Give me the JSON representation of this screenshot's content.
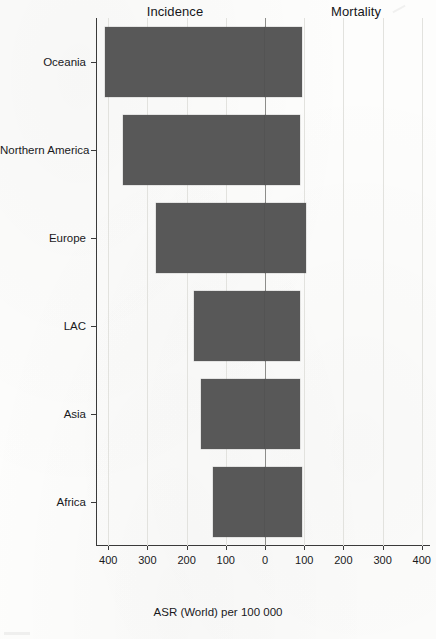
{
  "figure": {
    "panel_headers": {
      "left": "Incidence",
      "right": "Mortality"
    },
    "axis_title": "ASR (World) per 100 000",
    "bar_color": "#585858",
    "grid_color": "#e2e2de",
    "zero_line_color": "#8d8d8a"
  },
  "chart_data": {
    "type": "bar",
    "orientation": "horizontal",
    "subtype": "back-to-back population pyramid (mirrored bar chart)",
    "title": "",
    "xlabel": "ASR (World) per 100 000",
    "ylabel": "",
    "categories": [
      "Oceania",
      "Northern America",
      "Europe",
      "LAC",
      "Asia",
      "Africa"
    ],
    "series": [
      {
        "name": "Incidence",
        "side": "left",
        "values": [
          408,
          362,
          277,
          182,
          164,
          133
        ]
      },
      {
        "name": "Mortality",
        "side": "right",
        "values": [
          95,
          90,
          105,
          90,
          90,
          95
        ]
      }
    ],
    "xticks_left": [
      400,
      300,
      200,
      100
    ],
    "xtick_zero": 0,
    "xticks_right": [
      100,
      200,
      300,
      400
    ],
    "xtick_labels": [
      "400",
      "300",
      "200",
      "100",
      "0",
      "100",
      "200",
      "300",
      "400"
    ],
    "xlim_left": [
      0,
      440
    ],
    "xlim_right": [
      0,
      425
    ],
    "grid": true,
    "legend": "none (panel headers used instead)"
  }
}
